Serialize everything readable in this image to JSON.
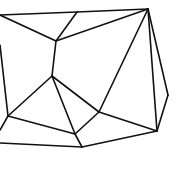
{
  "diagram": {
    "type": "planar-graph",
    "stroke_color": "#111111",
    "background": "#ffffff",
    "vertices": {
      "TL": [
        0,
        15
      ],
      "B": [
        77,
        12
      ],
      "C": [
        148,
        9
      ],
      "D": [
        56,
        41
      ],
      "E": [
        52,
        76
      ],
      "LE": [
        0,
        45
      ],
      "F": [
        8,
        116
      ],
      "LB": [
        0,
        130
      ],
      "G": [
        99,
        112
      ],
      "I": [
        168,
        95
      ],
      "H": [
        157,
        131
      ],
      "J": [
        75,
        134
      ],
      "BL": [
        0,
        143
      ],
      "K": [
        82,
        147
      ]
    },
    "edges": [
      [
        "TL",
        "B"
      ],
      [
        "B",
        "C"
      ],
      [
        "TL",
        "D"
      ],
      [
        "B",
        "D"
      ],
      [
        "D",
        "C"
      ],
      [
        "D",
        "E"
      ],
      [
        "LE",
        "F"
      ],
      [
        "F",
        "LB"
      ],
      [
        "E",
        "F"
      ],
      [
        "E",
        "G"
      ],
      [
        "E",
        "J"
      ],
      [
        "C",
        "G"
      ],
      [
        "C",
        "H"
      ],
      [
        "C",
        "I"
      ],
      [
        "I",
        "H"
      ],
      [
        "F",
        "J"
      ],
      [
        "G",
        "J"
      ],
      [
        "G",
        "H"
      ],
      [
        "J",
        "K"
      ],
      [
        "BL",
        "K"
      ],
      [
        "K",
        "H"
      ]
    ]
  }
}
